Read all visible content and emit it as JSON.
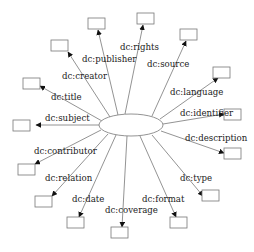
{
  "diagram": {
    "type": "star",
    "hub": {
      "cx": 131,
      "cy": 125,
      "rx": 32,
      "ry": 11,
      "label": ""
    },
    "arrow_color": "#111111",
    "line_color": "#777777",
    "edges": [
      {
        "label": "dc:rights",
        "box": [
          137,
          13
        ],
        "from": [
          125,
          114
        ],
        "to": [
          143,
          25
        ],
        "lx": 120,
        "ly": 50
      },
      {
        "label": "dc:publisher",
        "box": [
          88,
          18
        ],
        "from": [
          118,
          115
        ],
        "to": [
          98,
          30
        ],
        "lx": 82,
        "ly": 62
      },
      {
        "label": "dc:source",
        "box": [
          180,
          29
        ],
        "from": [
          152,
          116
        ],
        "to": [
          186,
          41
        ],
        "lx": 147,
        "ly": 67
      },
      {
        "label": "dc:creator",
        "box": [
          51,
          40
        ],
        "from": [
          110,
          117
        ],
        "to": [
          68,
          52
        ],
        "lx": 62,
        "ly": 79
      },
      {
        "label": "dc:language",
        "box": [
          213,
          67
        ],
        "from": [
          160,
          119
        ],
        "to": [
          218,
          78
        ],
        "lx": 170,
        "ly": 95
      },
      {
        "label": "dc:title",
        "box": [
          23,
          78
        ],
        "from": [
          102,
          121
        ],
        "to": [
          40,
          86
        ],
        "lx": 51,
        "ly": 100
      },
      {
        "label": "dc:identifier",
        "box": [
          224,
          109
        ],
        "from": [
          163,
          124
        ],
        "to": [
          224,
          114
        ],
        "lx": 180,
        "ly": 116
      },
      {
        "label": "dc:subject",
        "box": [
          13,
          120
        ],
        "from": [
          99,
          125
        ],
        "to": [
          36,
          125
        ],
        "lx": 45,
        "ly": 121
      },
      {
        "label": "dc:description",
        "box": [
          224,
          148
        ],
        "from": [
          161,
          131
        ],
        "to": [
          224,
          153
        ],
        "lx": 185,
        "ly": 141
      },
      {
        "label": "dc:contributor",
        "box": [
          18,
          164
        ],
        "from": [
          101,
          130
        ],
        "to": [
          35,
          164
        ],
        "lx": 34,
        "ly": 154
      },
      {
        "label": "dc:type",
        "box": [
          202,
          190
        ],
        "from": [
          152,
          135
        ],
        "to": [
          203,
          196
        ],
        "lx": 180,
        "ly": 181
      },
      {
        "label": "dc:relation",
        "box": [
          35,
          196
        ],
        "from": [
          108,
          134
        ],
        "to": [
          52,
          196
        ],
        "lx": 45,
        "ly": 181
      },
      {
        "label": "dc:date",
        "box": [
          67,
          217
        ],
        "from": [
          116,
          135
        ],
        "to": [
          79,
          217
        ],
        "lx": 72,
        "ly": 202
      },
      {
        "label": "dc:format",
        "box": [
          170,
          217
        ],
        "from": [
          140,
          136
        ],
        "to": [
          176,
          217
        ],
        "lx": 142,
        "ly": 202
      },
      {
        "label": "dc:coverage",
        "box": [
          111,
          227
        ],
        "from": [
          127,
          136
        ],
        "to": [
          122,
          227
        ],
        "lx": 105,
        "ly": 213
      }
    ],
    "box_size": [
      17,
      11
    ]
  }
}
